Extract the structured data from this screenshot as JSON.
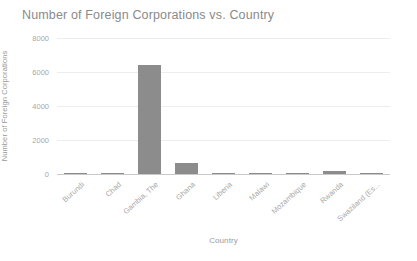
{
  "chart_data": {
    "type": "bar",
    "title": "Number of Foreign Corporations vs. Country",
    "xlabel": "Country",
    "ylabel": "Number of Foreign Corporations",
    "categories": [
      "Burundi",
      "Chad",
      "Gambia, The",
      "Ghana",
      "Liberia",
      "Malawi",
      "Mozambique",
      "Rwanda",
      "Swaziland (Es..."
    ],
    "values": [
      8,
      5,
      6400,
      650,
      10,
      6,
      12,
      150,
      14
    ],
    "ylim": [
      0,
      8000
    ],
    "yticks": [
      0,
      2000,
      4000,
      6000,
      8000
    ],
    "ytick_labels": [
      "0",
      "2000",
      "4000",
      "6000",
      "8000"
    ],
    "grid": true,
    "legend": "none",
    "series_name": "Number of Foreign Corporations",
    "colors": {
      "bar": "#8c8c8c",
      "gridline": "#ededed",
      "axis_line": "#c9c9c9",
      "title_text": "#8a8a8a",
      "tick_text": "#a8a8a8",
      "axis_label_text": "#9a9a9a",
      "background": "#ffffff"
    }
  }
}
